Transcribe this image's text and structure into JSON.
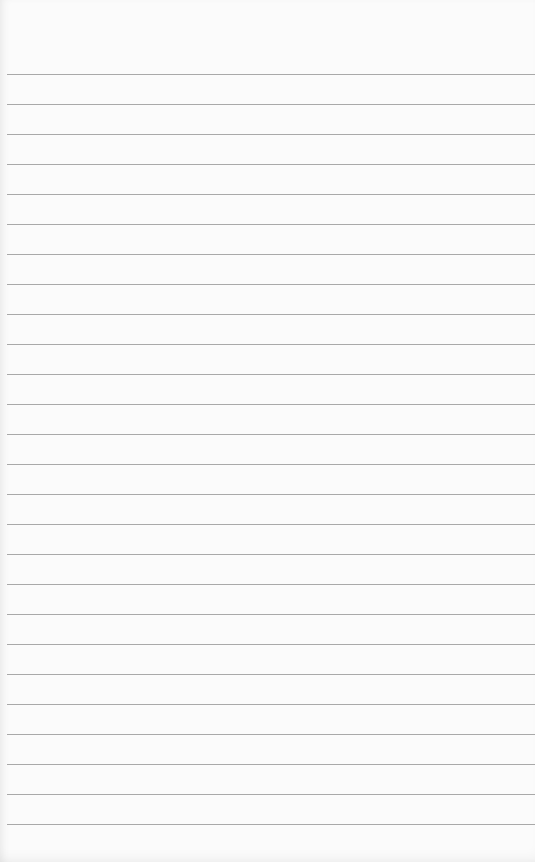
{
  "paper": {
    "type": "lined notepad sheet",
    "background_color": "#fbfbfb",
    "line_color": "#a9a9a9",
    "first_line_y": 74,
    "line_spacing": 30,
    "line_count": 26,
    "text": ""
  }
}
